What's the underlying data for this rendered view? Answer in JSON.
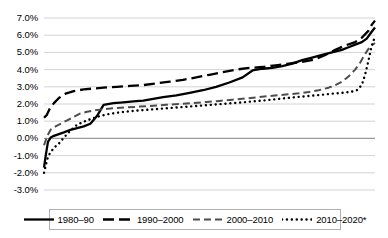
{
  "chart_data": {
    "type": "line",
    "title": "",
    "subtitle": "",
    "xlabel": "",
    "ylabel": "",
    "grid": true,
    "legend_position": "bottom",
    "ylim": [
      -3.0,
      7.0
    ],
    "xlim": [
      0,
      100
    ],
    "y_ticks": [
      "7.0%",
      "6.0%",
      "5.0%",
      "4.0%",
      "3.0%",
      "2.0%",
      "1.0%",
      "0.0%",
      "-1.0%",
      "-2.0%",
      "-3.0%"
    ],
    "y_tick_values": [
      7.0,
      6.0,
      5.0,
      4.0,
      3.0,
      2.0,
      1.0,
      0.0,
      -1.0,
      -2.0,
      -3.0
    ],
    "x_ticks": [],
    "x_tick_labels": [],
    "zero_line": 0.0,
    "series": [
      {
        "name": "1980–90",
        "style": "solid",
        "color": "#000000",
        "x": [
          0,
          0.6,
          1.2,
          2.0,
          3.0,
          4.5,
          6.0,
          8.0,
          10.0,
          12.0,
          14.0,
          16.0,
          18.0,
          21.0,
          24.0,
          27.0,
          30.0,
          33.0,
          36.0,
          40.0,
          44.0,
          48.0,
          52.0,
          56.0,
          60.0,
          63.0,
          66.0,
          69.0,
          72.0,
          75.0,
          78.0,
          81.0,
          84.0,
          87.0,
          90.0,
          92.0,
          94.0,
          96.0,
          97.5,
          99.0,
          100.0
        ],
        "y": [
          -1.7,
          -0.9,
          -0.2,
          0.05,
          0.15,
          0.25,
          0.35,
          0.5,
          0.6,
          0.7,
          0.85,
          1.3,
          1.95,
          2.05,
          2.1,
          2.15,
          2.2,
          2.3,
          2.4,
          2.5,
          2.65,
          2.8,
          3.0,
          3.25,
          3.55,
          3.95,
          4.05,
          4.1,
          4.2,
          4.35,
          4.55,
          4.7,
          4.85,
          5.0,
          5.15,
          5.3,
          5.45,
          5.6,
          5.8,
          6.2,
          6.45
        ]
      },
      {
        "name": "1990–2000",
        "style": "dash-long",
        "color": "#000000",
        "x": [
          0,
          0.8,
          1.8,
          3.0,
          4.5,
          6.5,
          9.0,
          12.0,
          15.0,
          18.0,
          22.0,
          26.0,
          30.0,
          34.0,
          38.0,
          42.0,
          46.0,
          50.0,
          54.0,
          58.0,
          62.0,
          66.0,
          70.0,
          74.0,
          78.0,
          82.0,
          85.0,
          88.0,
          91.0,
          94.0,
          96.0,
          98.0,
          99.0,
          100.0
        ],
        "y": [
          1.2,
          1.35,
          1.75,
          2.05,
          2.35,
          2.6,
          2.75,
          2.85,
          2.9,
          2.95,
          3.0,
          3.05,
          3.1,
          3.2,
          3.3,
          3.4,
          3.55,
          3.7,
          3.85,
          4.0,
          4.1,
          4.15,
          4.25,
          4.35,
          4.45,
          4.6,
          4.85,
          5.15,
          5.4,
          5.6,
          5.85,
          6.25,
          6.6,
          6.85
        ]
      },
      {
        "name": "2000–2010",
        "style": "dash-med",
        "color": "#4d4d4d",
        "x": [
          0,
          1.0,
          2.0,
          3.5,
          5.0,
          7.0,
          9.0,
          11.0,
          13.0,
          15.0,
          18.0,
          21.0,
          25.0,
          29.0,
          33.0,
          37.0,
          41.0,
          45.0,
          49.0,
          53.0,
          57.0,
          61.0,
          65.0,
          69.0,
          73.0,
          77.0,
          80.0,
          83.0,
          86.0,
          88.0,
          90.0,
          92.0,
          94.0,
          95.5,
          97.0,
          98.0,
          99.0,
          100.0
        ],
        "y": [
          -0.4,
          0.15,
          0.5,
          0.7,
          0.85,
          1.05,
          1.25,
          1.45,
          1.55,
          1.62,
          1.7,
          1.75,
          1.8,
          1.85,
          1.9,
          1.95,
          2.0,
          2.05,
          2.12,
          2.18,
          2.25,
          2.32,
          2.4,
          2.48,
          2.55,
          2.62,
          2.7,
          2.8,
          2.95,
          3.1,
          3.3,
          3.6,
          4.0,
          4.4,
          4.9,
          5.2,
          5.4,
          5.55
        ]
      },
      {
        "name": "2010–2020*",
        "style": "dotted",
        "color": "#000000",
        "x": [
          0,
          0.5,
          1.0,
          1.8,
          3.0,
          4.5,
          6.0,
          8.0,
          10.0,
          13.0,
          16.0,
          19.0,
          23.0,
          27.0,
          31.0,
          35.0,
          39.0,
          43.0,
          47.0,
          51.0,
          55.0,
          59.0,
          63.0,
          67.0,
          71.0,
          75.0,
          79.0,
          83.0,
          86.0,
          89.0,
          91.0,
          93.0,
          94.5,
          96.0,
          97.0,
          98.0,
          99.0,
          100.0
        ],
        "y": [
          -2.0,
          -1.6,
          -1.2,
          -0.85,
          -0.55,
          -0.3,
          0.05,
          0.45,
          0.8,
          1.05,
          1.25,
          1.4,
          1.52,
          1.6,
          1.66,
          1.72,
          1.78,
          1.84,
          1.9,
          1.96,
          2.02,
          2.08,
          2.15,
          2.22,
          2.3,
          2.38,
          2.45,
          2.52,
          2.58,
          2.63,
          2.67,
          2.72,
          2.8,
          3.1,
          3.7,
          4.5,
          5.4,
          5.9
        ]
      }
    ]
  },
  "legend": {
    "items": [
      {
        "label": "1980–90",
        "style": "solid"
      },
      {
        "label": "1990–2000",
        "style": "dash-long"
      },
      {
        "label": "2000–2010",
        "style": "dash-med"
      },
      {
        "label": "2010–2020*",
        "style": "dotted"
      }
    ]
  },
  "colors": {
    "gridline": "#c8c8c8",
    "zero_line": "#9a9a9a",
    "legend_border": "#b0b0b0",
    "background": "#ffffff",
    "text": "#000000"
  }
}
